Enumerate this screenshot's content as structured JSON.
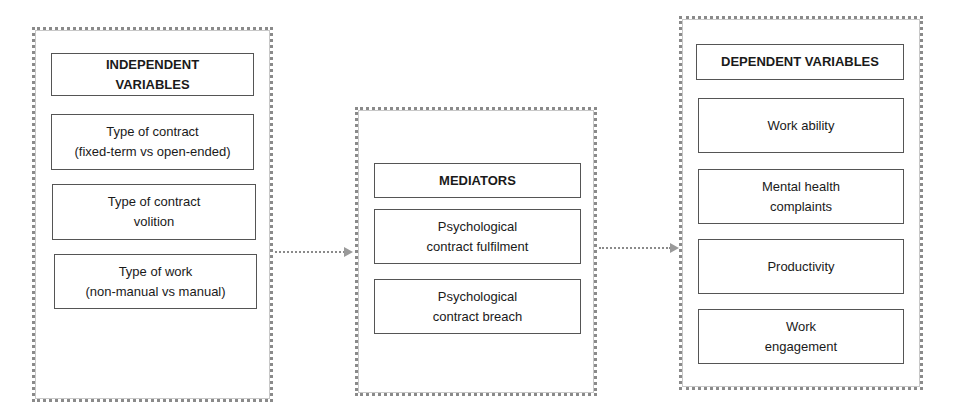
{
  "diagram": {
    "independent": {
      "title": "INDEPENDENT\nVARIABLES",
      "items": [
        "Type of contract\n(fixed-term vs open-ended)",
        "Type of contract\nvolition",
        "Type of work\n(non-manual vs manual)"
      ]
    },
    "mediators": {
      "title": "MEDIATORS",
      "items": [
        "Psychological\ncontract fulfilment",
        "Psychological\ncontract breach"
      ]
    },
    "dependent": {
      "title": "DEPENDENT VARIABLES",
      "items": [
        "Work ability",
        "Mental health\ncomplaints",
        "Productivity",
        "Work\nengagement"
      ]
    },
    "edges": [
      {
        "from": "independent",
        "to": "mediators"
      },
      {
        "from": "mediators",
        "to": "dependent"
      }
    ]
  }
}
